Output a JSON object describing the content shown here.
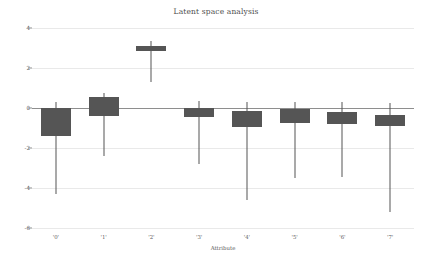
{
  "chart_data": {
    "type": "bar",
    "subtype": "box-whisker-candlestick",
    "title": "Latent space analysis",
    "xlabel": "Attribute",
    "ylabel": "",
    "categories": [
      "'0'",
      "'1'",
      "'2'",
      "'3'",
      "'4'",
      "'5'",
      "'6'",
      "'7'"
    ],
    "ylim": [
      -6,
      4
    ],
    "yticks": [
      4,
      2,
      0,
      -2,
      -4,
      -6
    ],
    "ytick_labels": [
      "4",
      "2",
      "0",
      "-2",
      "-4",
      "-6"
    ],
    "grid": true,
    "legend": false,
    "box_color": "#555555",
    "whisker_color": "#555555",
    "grid_color": "#e9e9e9",
    "zero_line_color": "#8e8e8e",
    "background": "#ffffff",
    "series": [
      {
        "name": "box_top",
        "values": [
          0.0,
          0.55,
          3.1,
          0.0,
          -0.15,
          -0.05,
          -0.2,
          -0.35
        ]
      },
      {
        "name": "box_bottom",
        "values": [
          -1.4,
          -0.4,
          2.85,
          -0.45,
          -0.95,
          -0.75,
          -0.8,
          -0.9
        ]
      },
      {
        "name": "whisker_high",
        "values": [
          0.3,
          0.75,
          3.35,
          0.35,
          0.3,
          0.3,
          0.3,
          0.25
        ]
      },
      {
        "name": "whisker_low",
        "values": [
          -4.3,
          -2.4,
          1.3,
          -2.8,
          -4.6,
          -3.5,
          -3.45,
          -5.2
        ]
      }
    ],
    "points": [
      {
        "category": "'0'",
        "box_top": 0.0,
        "box_bottom": -1.4,
        "whisker_high": 0.3,
        "whisker_low": -4.3
      },
      {
        "category": "'1'",
        "box_top": 0.55,
        "box_bottom": -0.4,
        "whisker_high": 0.75,
        "whisker_low": -2.4
      },
      {
        "category": "'2'",
        "box_top": 3.1,
        "box_bottom": 2.85,
        "whisker_high": 3.35,
        "whisker_low": 1.3
      },
      {
        "category": "'3'",
        "box_top": 0.0,
        "box_bottom": -0.45,
        "whisker_high": 0.35,
        "whisker_low": -2.8
      },
      {
        "category": "'4'",
        "box_top": -0.15,
        "box_bottom": -0.95,
        "whisker_high": 0.3,
        "whisker_low": -4.6
      },
      {
        "category": "'5'",
        "box_top": -0.05,
        "box_bottom": -0.75,
        "whisker_high": 0.3,
        "whisker_low": -3.5
      },
      {
        "category": "'6'",
        "box_top": -0.2,
        "box_bottom": -0.8,
        "whisker_high": 0.3,
        "whisker_low": -3.45
      },
      {
        "category": "'7'",
        "box_top": -0.35,
        "box_bottom": -0.9,
        "whisker_high": 0.25,
        "whisker_low": -5.2
      }
    ]
  }
}
